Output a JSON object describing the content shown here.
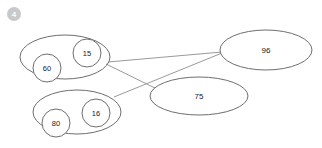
{
  "badge": {
    "name": "step-badge",
    "label": "4",
    "color": "#c9c9c9",
    "text_color": "#ffffff",
    "cx": 14,
    "cy": 14,
    "r": 7
  },
  "canvas": {
    "width": 322,
    "height": 148,
    "background": "#ffffff",
    "stroke_color": "#6e6e6e",
    "line_color": "#9a9a9a"
  },
  "diagram": {
    "groups": [
      {
        "id": "group-top-left",
        "cx": 65,
        "cy": 57,
        "rx": 45,
        "ry": 22
      },
      {
        "id": "group-bottom-left",
        "cx": 77,
        "cy": 112,
        "rx": 44,
        "ry": 22
      }
    ],
    "nodes": [
      {
        "id": "node-60",
        "label": "60",
        "cx": 47,
        "cy": 68,
        "r": 14,
        "shape": "circle"
      },
      {
        "id": "node-15",
        "label": "15",
        "cx": 87,
        "cy": 53,
        "r": 14,
        "shape": "circle"
      },
      {
        "id": "node-80",
        "label": "80",
        "cx": 56,
        "cy": 123,
        "r": 14,
        "shape": "circle"
      },
      {
        "id": "node-16",
        "label": "16",
        "cx": 96,
        "cy": 113,
        "r": 14,
        "shape": "circle"
      },
      {
        "id": "node-96",
        "label": "96",
        "cx": 266,
        "cy": 50,
        "rx": 46,
        "ry": 20,
        "shape": "ellipse"
      },
      {
        "id": "node-75",
        "label": "75",
        "cx": 199,
        "cy": 96,
        "rx": 49,
        "ry": 19,
        "shape": "ellipse"
      }
    ],
    "connectors": [
      {
        "id": "connector-topleft-to-96",
        "x1": 108,
        "y1": 62,
        "x2": 222,
        "y2": 52
      },
      {
        "id": "connector-bottomleft-to-96",
        "x1": 114,
        "y1": 97,
        "x2": 222,
        "y2": 53
      },
      {
        "id": "connector-topleft-to-75",
        "x1": 106,
        "y1": 64,
        "x2": 156,
        "y2": 90
      }
    ]
  }
}
